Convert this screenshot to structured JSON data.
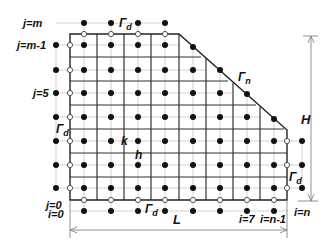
{
  "diagram": {
    "labels": {
      "j_m": "j=m",
      "j_m_minus_1": "j=m-1",
      "j_5": "j=5",
      "j_0": "j=0",
      "i_0": "i=0",
      "i_7": "i=7",
      "i_n_minus_1": "i=n-1",
      "i_n": "i=n",
      "gamma_d_top": "Γ",
      "gamma_d_top_sub": "d",
      "gamma_d_left": "Γ",
      "gamma_d_left_sub": "d",
      "gamma_d_bottom": "Γ",
      "gamma_d_bottom_sub": "d",
      "gamma_d_right": "Γ",
      "gamma_d_right_sub": "d",
      "gamma_n": "Γ",
      "gamma_n_sub": "n",
      "k": "k",
      "h": "h",
      "L": "L",
      "H": "H"
    },
    "boundaries": {
      "dirichlet": "Γd",
      "neumann": "Γn"
    },
    "legend_symbols": {
      "interior_node": "filled-circle",
      "boundary_node": "open-circle"
    },
    "colors": {
      "ink": "#111111",
      "thin_line": "#bdbdbd",
      "thick_line": "#333333"
    },
    "grid": {
      "columns_x": [
        84,
        111,
        138,
        165,
        193,
        220,
        247,
        274
      ],
      "rows_y": [
        45,
        70,
        93,
        117,
        141,
        165,
        188
      ],
      "cell_width": 27,
      "cell_height": 24
    }
  }
}
